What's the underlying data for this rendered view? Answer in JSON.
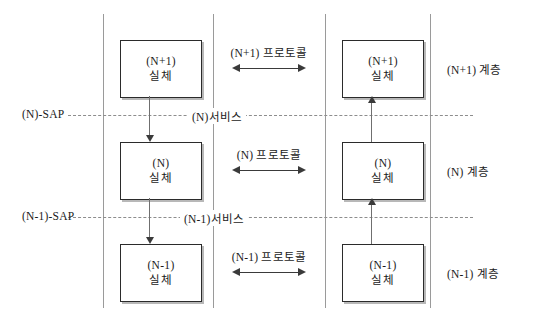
{
  "diagram": {
    "columns": {
      "left_system_label": "",
      "center_label": "",
      "right_system_label": ""
    },
    "entities": {
      "left": [
        {
          "line1": "(N+1)",
          "line2": "실체"
        },
        {
          "line1": "(N)",
          "line2": "실체"
        },
        {
          "line1": "(N-1)",
          "line2": "실체"
        }
      ],
      "right": [
        {
          "line1": "(N+1)",
          "line2": "실체"
        },
        {
          "line1": "(N)",
          "line2": "실체"
        },
        {
          "line1": "(N-1)",
          "line2": "실체"
        }
      ]
    },
    "protocols": [
      {
        "label": "(N+1)  프로토콜"
      },
      {
        "label": "(N)  프로토콜"
      },
      {
        "label": "(N-1)  프로토콜"
      }
    ],
    "sap_labels": [
      {
        "label": "(N)-SAP"
      },
      {
        "label": "(N-1)-SAP"
      }
    ],
    "service_labels": [
      {
        "label": "(N)서비스"
      },
      {
        "label": "(N-1)서비스"
      }
    ],
    "layer_labels": [
      {
        "label": "(N+1) 계층"
      },
      {
        "label": "(N) 계층"
      },
      {
        "label": "(N-1) 계층"
      }
    ],
    "colors": {
      "box_border": "#2b2b2b",
      "box_shadow": "#b8b8b8",
      "column_line": "#9a9a9a",
      "dashed_line": "#8d8d8d",
      "arrow": "#3a3a3a",
      "text": "#1a1a1a",
      "background": "#ffffff"
    }
  }
}
